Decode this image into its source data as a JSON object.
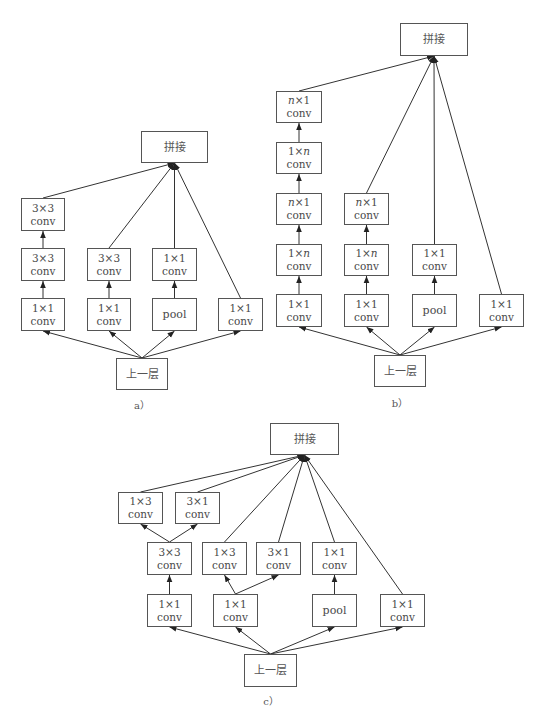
{
  "figure": {
    "colors": {
      "stroke": "#333333",
      "box_border": "#555555",
      "text": "#4a4a4a",
      "background": "#ffffff"
    },
    "panels": [
      {
        "id": "a",
        "caption": "a）",
        "caption_pos": [
          142,
          404
        ],
        "nodes": [
          {
            "id": "concat",
            "l1": "拼接",
            "l2": "",
            "x": 141,
            "y": 131,
            "w": 67,
            "h": 32,
            "type": "concat"
          },
          {
            "id": "c1r3",
            "l1": "3×3",
            "l2": "conv",
            "x": 21,
            "y": 198,
            "w": 44,
            "h": 33
          },
          {
            "id": "c1r2",
            "l1": "3×3",
            "l2": "conv",
            "x": 21,
            "y": 248,
            "w": 44,
            "h": 33
          },
          {
            "id": "c1r1",
            "l1": "1×1",
            "l2": "conv",
            "x": 21,
            "y": 298,
            "w": 44,
            "h": 33
          },
          {
            "id": "c2r2",
            "l1": "3×3",
            "l2": "conv",
            "x": 87,
            "y": 248,
            "w": 44,
            "h": 33
          },
          {
            "id": "c2r1",
            "l1": "1×1",
            "l2": "conv",
            "x": 87,
            "y": 298,
            "w": 44,
            "h": 33
          },
          {
            "id": "c3r2",
            "l1": "1×1",
            "l2": "conv",
            "x": 152,
            "y": 248,
            "w": 45,
            "h": 33
          },
          {
            "id": "c3r1",
            "l1": "pool",
            "l2": "",
            "x": 152,
            "y": 298,
            "w": 45,
            "h": 33
          },
          {
            "id": "c4r1",
            "l1": "1×1",
            "l2": "conv",
            "x": 218,
            "y": 298,
            "w": 45,
            "h": 33
          },
          {
            "id": "input",
            "l1": "上一层",
            "l2": "",
            "x": 116,
            "y": 358,
            "w": 52,
            "h": 32,
            "type": "input"
          }
        ],
        "edges": [
          {
            "from": "input",
            "to": "c1r1"
          },
          {
            "from": "input",
            "to": "c2r1"
          },
          {
            "from": "input",
            "to": "c3r1"
          },
          {
            "from": "input",
            "to": "c4r1"
          },
          {
            "from": "c1r1",
            "to": "c1r2"
          },
          {
            "from": "c1r2",
            "to": "c1r3"
          },
          {
            "from": "c2r1",
            "to": "c2r2"
          },
          {
            "from": "c3r1",
            "to": "c3r2"
          },
          {
            "from": "c1r3",
            "to": "concat"
          },
          {
            "from": "c2r2",
            "to": "concat"
          },
          {
            "from": "c3r2",
            "to": "concat"
          },
          {
            "from": "c4r1",
            "to": "concat"
          }
        ]
      },
      {
        "id": "b",
        "caption": "b）",
        "caption_pos": [
          400,
          402
        ],
        "nodes": [
          {
            "id": "concat",
            "l1": "拼接",
            "l2": "",
            "x": 400,
            "y": 23,
            "w": 68,
            "h": 33,
            "type": "concat"
          },
          {
            "id": "c1r5",
            "l1": "n×1",
            "l2": "conv",
            "x": 276,
            "y": 91,
            "w": 46,
            "h": 32,
            "italic_n": true
          },
          {
            "id": "c1r4",
            "l1": "1×n",
            "l2": "conv",
            "x": 276,
            "y": 142,
            "w": 46,
            "h": 32,
            "italic_n": true
          },
          {
            "id": "c1r3",
            "l1": "n×1",
            "l2": "conv",
            "x": 276,
            "y": 193,
            "w": 46,
            "h": 32,
            "italic_n": true
          },
          {
            "id": "c1r2",
            "l1": "1×n",
            "l2": "conv",
            "x": 276,
            "y": 244,
            "w": 46,
            "h": 32,
            "italic_n": true
          },
          {
            "id": "c1r1",
            "l1": "1×1",
            "l2": "conv",
            "x": 276,
            "y": 294,
            "w": 46,
            "h": 33
          },
          {
            "id": "c2r3",
            "l1": "n×1",
            "l2": "conv",
            "x": 344,
            "y": 193,
            "w": 45,
            "h": 32,
            "italic_n": true
          },
          {
            "id": "c2r2",
            "l1": "1×n",
            "l2": "conv",
            "x": 344,
            "y": 244,
            "w": 45,
            "h": 32,
            "italic_n": true
          },
          {
            "id": "c2r1",
            "l1": "1×1",
            "l2": "conv",
            "x": 344,
            "y": 294,
            "w": 45,
            "h": 33
          },
          {
            "id": "c3r2",
            "l1": "1×1",
            "l2": "conv",
            "x": 412,
            "y": 244,
            "w": 45,
            "h": 32
          },
          {
            "id": "c3r1",
            "l1": "pool",
            "l2": "",
            "x": 412,
            "y": 294,
            "w": 45,
            "h": 33
          },
          {
            "id": "c4r1",
            "l1": "1×1",
            "l2": "conv",
            "x": 479,
            "y": 294,
            "w": 45,
            "h": 33
          },
          {
            "id": "input",
            "l1": "上一层",
            "l2": "",
            "x": 374,
            "y": 355,
            "w": 52,
            "h": 32,
            "type": "input"
          }
        ],
        "edges": [
          {
            "from": "input",
            "to": "c1r1"
          },
          {
            "from": "input",
            "to": "c2r1"
          },
          {
            "from": "input",
            "to": "c3r1"
          },
          {
            "from": "input",
            "to": "c4r1"
          },
          {
            "from": "c1r1",
            "to": "c1r2"
          },
          {
            "from": "c1r2",
            "to": "c1r3"
          },
          {
            "from": "c1r3",
            "to": "c1r4"
          },
          {
            "from": "c1r4",
            "to": "c1r5"
          },
          {
            "from": "c2r1",
            "to": "c2r2"
          },
          {
            "from": "c2r2",
            "to": "c2r3"
          },
          {
            "from": "c3r1",
            "to": "c3r2"
          },
          {
            "from": "c1r5",
            "to": "concat"
          },
          {
            "from": "c2r3",
            "to": "concat"
          },
          {
            "from": "c3r2",
            "to": "concat"
          },
          {
            "from": "c4r1",
            "to": "concat"
          }
        ]
      },
      {
        "id": "c",
        "caption": "c）",
        "caption_pos": [
          271,
          700
        ],
        "nodes": [
          {
            "id": "concat",
            "l1": "拼接",
            "l2": "",
            "x": 270,
            "y": 423,
            "w": 69,
            "h": 32,
            "type": "concat"
          },
          {
            "id": "a13",
            "l1": "1×3",
            "l2": "conv",
            "x": 118,
            "y": 492,
            "w": 45,
            "h": 32
          },
          {
            "id": "a31",
            "l1": "3×1",
            "l2": "conv",
            "x": 175,
            "y": 492,
            "w": 45,
            "h": 32
          },
          {
            "id": "a33",
            "l1": "3×3",
            "l2": "conv",
            "x": 147,
            "y": 542,
            "w": 45,
            "h": 33
          },
          {
            "id": "b13",
            "l1": "1×3",
            "l2": "conv",
            "x": 202,
            "y": 542,
            "w": 45,
            "h": 33
          },
          {
            "id": "b31",
            "l1": "3×1",
            "l2": "conv",
            "x": 256,
            "y": 542,
            "w": 45,
            "h": 33
          },
          {
            "id": "p11",
            "l1": "1×1",
            "l2": "conv",
            "x": 312,
            "y": 542,
            "w": 45,
            "h": 33
          },
          {
            "id": "a11",
            "l1": "1×1",
            "l2": "conv",
            "x": 147,
            "y": 594,
            "w": 45,
            "h": 33
          },
          {
            "id": "b11",
            "l1": "1×1",
            "l2": "conv",
            "x": 213,
            "y": 594,
            "w": 45,
            "h": 33
          },
          {
            "id": "pool",
            "l1": "pool",
            "l2": "",
            "x": 312,
            "y": 594,
            "w": 45,
            "h": 33
          },
          {
            "id": "d11",
            "l1": "1×1",
            "l2": "conv",
            "x": 380,
            "y": 594,
            "w": 45,
            "h": 33
          },
          {
            "id": "input",
            "l1": "上一层",
            "l2": "",
            "x": 244,
            "y": 654,
            "w": 53,
            "h": 33,
            "type": "input"
          }
        ],
        "edges": [
          {
            "from": "input",
            "to": "a11"
          },
          {
            "from": "input",
            "to": "b11"
          },
          {
            "from": "input",
            "to": "pool"
          },
          {
            "from": "input",
            "to": "d11"
          },
          {
            "from": "a11",
            "to": "a33"
          },
          {
            "from": "a33",
            "to": "a13"
          },
          {
            "from": "a33",
            "to": "a31"
          },
          {
            "from": "b11",
            "to": "b13"
          },
          {
            "from": "b11",
            "to": "b31"
          },
          {
            "from": "pool",
            "to": "p11"
          },
          {
            "from": "a13",
            "to": "concat"
          },
          {
            "from": "a31",
            "to": "concat"
          },
          {
            "from": "b13",
            "to": "concat"
          },
          {
            "from": "b31",
            "to": "concat"
          },
          {
            "from": "p11",
            "to": "concat"
          },
          {
            "from": "d11",
            "to": "concat"
          }
        ]
      }
    ]
  }
}
